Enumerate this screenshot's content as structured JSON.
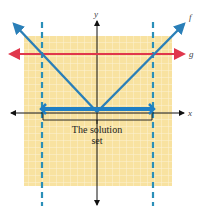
{
  "diagram": {
    "type": "graph of absolute value inequality",
    "colors": {
      "grid_background": "#f8e2a0",
      "grid_lines": "#fdf3d4",
      "f_line": "#2a7fb8",
      "g_line": "#e0374c",
      "dashed_lines": "#2a8fb8",
      "axes": "#111111",
      "solution_bar": "#1f7fc4"
    },
    "axes": {
      "x_label": "x",
      "y_label": "y"
    },
    "functions": [
      {
        "name": "f",
        "label": "f",
        "shape": "V (absolute value)"
      },
      {
        "name": "g",
        "label": "g",
        "shape": "horizontal line"
      }
    ],
    "annotation": {
      "line1": "The solution",
      "line2": "set"
    }
  }
}
